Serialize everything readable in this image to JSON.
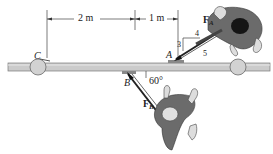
{
  "figure": {
    "dimensions": [
      {
        "label": "2 m",
        "from": "C",
        "to": "A_vertical_projection"
      },
      {
        "label": "1 m",
        "from": "A_vertical_projection",
        "to": "right_ref"
      }
    ],
    "points": {
      "A": "A",
      "B": "B",
      "C": "C"
    },
    "forces": {
      "FA": {
        "symbol": "F",
        "subscript": "A",
        "slope": {
          "rise": "3",
          "run": "4",
          "hyp": "5"
        }
      },
      "FB": {
        "symbol": "F",
        "subscript": "B",
        "angle": "60°"
      }
    },
    "colors": {
      "bar": "#c9c9c9",
      "bar_edge": "#7a7a7a",
      "wheel": "#cfcfcf",
      "person_shirt": "#6b6b6b",
      "person_dark": "#1a1a1a",
      "line": "#333333"
    }
  }
}
